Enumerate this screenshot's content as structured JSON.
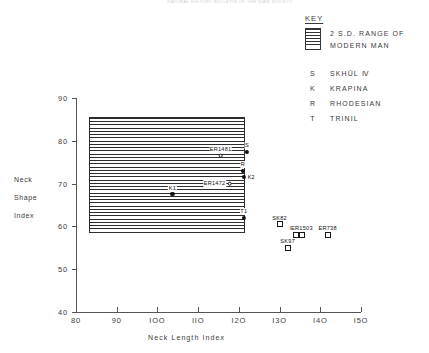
{
  "caption": "NATURAL HISTORY BULLETIN OF THE SIAM SOCIETY",
  "key": {
    "title": "KEY",
    "swatch_label_line1": "2 S.D.  RANGE   OF",
    "swatch_label_line2": "MODERN   MAN",
    "entries": [
      {
        "symbol": "S",
        "label": "SKHŪL Ⅳ"
      },
      {
        "symbol": "K",
        "label": "KRAPINA"
      },
      {
        "symbol": "R",
        "label": "RHODESIAN"
      },
      {
        "symbol": "T",
        "label": "TRINIL"
      }
    ]
  },
  "chart_data": {
    "type": "scatter",
    "title": "",
    "xlabel": "Neck  Length  Index",
    "ylabel_lines": [
      "Neck",
      "Shape",
      "Index"
    ],
    "xlim": [
      80,
      150
    ],
    "ylim": [
      40,
      90
    ],
    "xticks": [
      80,
      90,
      100,
      110,
      120,
      130,
      140,
      150
    ],
    "xtick_labels": [
      "80",
      "90",
      "IOO",
      "IIO",
      "I2O",
      "I3O",
      "I4O",
      "I5O"
    ],
    "yticks": [
      40,
      50,
      60,
      70,
      80,
      90
    ],
    "ytick_labels": [
      "40",
      "50",
      "60",
      "70",
      "80",
      "90"
    ],
    "grid": false,
    "legend_position": "top-right",
    "shaded_region": {
      "name": "2 S.D. range of modern man",
      "x_range": [
        83,
        122
      ],
      "y_range": [
        59,
        85
      ],
      "fill": "horizontal-hatch"
    },
    "points": [
      {
        "label": "ER1481",
        "x": 115.5,
        "y": 76.5,
        "marker": "open-circle",
        "label_pos": "above"
      },
      {
        "label": "S",
        "x": 122.0,
        "y": 77.5,
        "marker": "filled-circle",
        "label_pos": "above"
      },
      {
        "label": "R",
        "x": 121.0,
        "y": 73.0,
        "marker": "filled-circle",
        "label_pos": "above"
      },
      {
        "label": "K2",
        "x": 121.3,
        "y": 71.5,
        "marker": "filled-circle",
        "label_pos": "right"
      },
      {
        "label": "ER1472",
        "x": 117.8,
        "y": 70.0,
        "marker": "open-circle",
        "label_pos": "left"
      },
      {
        "label": "K1",
        "x": 103.7,
        "y": 67.5,
        "marker": "filled-circle",
        "label_pos": "above"
      },
      {
        "label": "T1",
        "x": 121.2,
        "y": 62.0,
        "marker": "filled-circle",
        "label_pos": "above"
      },
      {
        "label": "SK82",
        "x": 130.0,
        "y": 60.5,
        "marker": "open-square",
        "label_pos": "above"
      },
      {
        "label": "H2O",
        "x": 134.0,
        "y": 58.0,
        "marker": "open-square",
        "label_pos": "above"
      },
      {
        "label": "ER1503",
        "x": 135.5,
        "y": 58.0,
        "marker": "open-square",
        "label_pos": "above"
      },
      {
        "label": "ER738",
        "x": 141.8,
        "y": 58.0,
        "marker": "open-square",
        "label_pos": "above"
      },
      {
        "label": "SK97",
        "x": 132.0,
        "y": 55.0,
        "marker": "open-square",
        "label_pos": "above"
      }
    ]
  }
}
